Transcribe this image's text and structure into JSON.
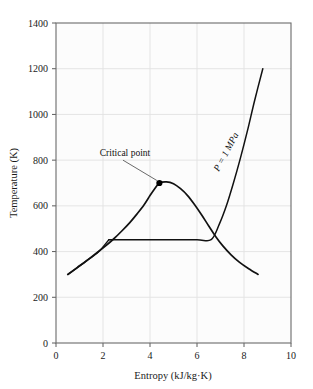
{
  "chart_data": {
    "type": "line",
    "title": "",
    "xlabel": "Entropy (kJ/kg·K)",
    "ylabel": "Temperature (K)",
    "xlim": [
      0,
      10
    ],
    "ylim": [
      0,
      1400
    ],
    "xticks": [
      "0",
      "2",
      "4",
      "6",
      "8",
      "10"
    ],
    "xtick_values": [
      0,
      2,
      4,
      6,
      8,
      10
    ],
    "yticks": [
      "0",
      "200",
      "400",
      "600",
      "800",
      "1000",
      "1200",
      "1400"
    ],
    "ytick_values": [
      0,
      200,
      400,
      600,
      800,
      1000,
      1200,
      1400
    ],
    "grid": true,
    "legend": "none",
    "series": [
      {
        "name": "saturation-dome",
        "comment": "T-s saturation dome, liquid branch up to critical point then vapor branch down",
        "points": [
          [
            0.5,
            300
          ],
          [
            0.9,
            330
          ],
          [
            1.3,
            360
          ],
          [
            1.7,
            392
          ],
          [
            2.1,
            424
          ],
          [
            2.45,
            455
          ],
          [
            2.8,
            490
          ],
          [
            3.15,
            528
          ],
          [
            3.45,
            565
          ],
          [
            3.75,
            605
          ],
          [
            4.0,
            645
          ],
          [
            4.2,
            675
          ],
          [
            4.4,
            700
          ],
          [
            4.7,
            705
          ],
          [
            5.0,
            697
          ],
          [
            5.3,
            675
          ],
          [
            5.6,
            645
          ],
          [
            5.9,
            605
          ],
          [
            6.2,
            560
          ],
          [
            6.5,
            512
          ],
          [
            6.8,
            465
          ],
          [
            7.1,
            425
          ],
          [
            7.45,
            386
          ],
          [
            7.8,
            354
          ],
          [
            8.2,
            325
          ],
          [
            8.6,
            300
          ]
        ]
      },
      {
        "name": "compressed-liquid-line",
        "comment": "nearly coincident with liquid branch from start to isobar junction",
        "points": [
          [
            0.52,
            300
          ],
          [
            1.2,
            352
          ],
          [
            1.8,
            398
          ],
          [
            2.25,
            452
          ]
        ]
      },
      {
        "name": "isobar-1MPa",
        "comment": "constant pressure line: horizontal through two-phase region then superheated vapor",
        "points": [
          [
            2.25,
            452
          ],
          [
            3.5,
            452
          ],
          [
            4.8,
            452
          ],
          [
            6.0,
            452
          ],
          [
            6.6,
            452
          ],
          [
            6.95,
            520
          ],
          [
            7.25,
            600
          ],
          [
            7.55,
            700
          ],
          [
            7.85,
            810
          ],
          [
            8.15,
            930
          ],
          [
            8.45,
            1060
          ],
          [
            8.8,
            1200
          ]
        ]
      }
    ],
    "markers": [
      {
        "name": "critical-point",
        "label": "Critical point",
        "x": 4.4,
        "y": 700,
        "leader_from_x": 2.85,
        "leader_from_y": 800
      }
    ],
    "annotations": [
      {
        "name": "isobar-pressure-label",
        "text": "P = 1 MPa",
        "x": 7.35,
        "y": 830,
        "rotation": -62
      }
    ]
  }
}
